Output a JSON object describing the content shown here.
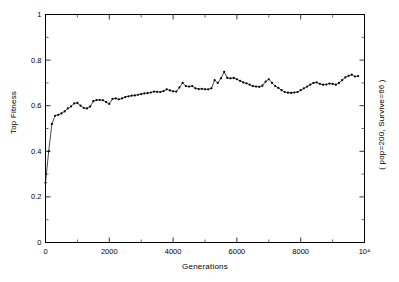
{
  "chart_data": {
    "type": "line",
    "title": "",
    "xlabel": "Generations",
    "ylabel": "Top Fitness",
    "annotation": "(  pop=200, Survive=66  )",
    "xlim": [
      0,
      10000
    ],
    "ylim": [
      0,
      1
    ],
    "xticks": [
      0,
      2000,
      4000,
      6000,
      8000,
      10000
    ],
    "xtick_labels": [
      "0",
      "2000",
      "4000",
      "6000",
      "8000",
      "10⁴"
    ],
    "yticks": [
      0,
      0.2,
      0.4,
      0.6,
      0.8,
      1
    ],
    "ytick_labels": [
      "0",
      "0.2",
      "0.4",
      "0.6",
      "0.8",
      "1"
    ],
    "grid": false,
    "legend": null,
    "marker": "filled-circle",
    "series": [
      {
        "name": "Top Fitness",
        "x": [
          0,
          100,
          200,
          300,
          400,
          500,
          600,
          700,
          800,
          900,
          1000,
          1100,
          1200,
          1300,
          1400,
          1500,
          1600,
          1700,
          1800,
          1900,
          2000,
          2100,
          2200,
          2300,
          2400,
          2500,
          2600,
          2700,
          2800,
          2900,
          3000,
          3100,
          3200,
          3300,
          3400,
          3500,
          3600,
          3700,
          3800,
          3900,
          4000,
          4100,
          4200,
          4300,
          4400,
          4500,
          4600,
          4700,
          4800,
          4900,
          5000,
          5100,
          5200,
          5300,
          5400,
          5500,
          5600,
          5700,
          5800,
          5900,
          6000,
          6100,
          6200,
          6300,
          6400,
          6500,
          6600,
          6700,
          6800,
          6900,
          7000,
          7100,
          7200,
          7300,
          7400,
          7500,
          7600,
          7700,
          7800,
          7900,
          8000,
          8100,
          8200,
          8300,
          8400,
          8500,
          8600,
          8700,
          8800,
          8900,
          9000,
          9100,
          9200,
          9300,
          9400,
          9500,
          9600,
          9700,
          9800
        ],
        "y": [
          0.262,
          0.4,
          0.52,
          0.556,
          0.56,
          0.566,
          0.575,
          0.588,
          0.597,
          0.61,
          0.612,
          0.6,
          0.59,
          0.588,
          0.596,
          0.62,
          0.625,
          0.625,
          0.624,
          0.616,
          0.608,
          0.63,
          0.632,
          0.628,
          0.632,
          0.638,
          0.641,
          0.644,
          0.645,
          0.648,
          0.651,
          0.654,
          0.655,
          0.658,
          0.662,
          0.661,
          0.66,
          0.664,
          0.672,
          0.667,
          0.663,
          0.662,
          0.68,
          0.7,
          0.686,
          0.684,
          0.686,
          0.676,
          0.673,
          0.674,
          0.672,
          0.672,
          0.676,
          0.712,
          0.7,
          0.72,
          0.748,
          0.722,
          0.72,
          0.722,
          0.716,
          0.709,
          0.702,
          0.698,
          0.692,
          0.686,
          0.684,
          0.683,
          0.688,
          0.706,
          0.716,
          0.7,
          0.686,
          0.678,
          0.668,
          0.66,
          0.657,
          0.656,
          0.658,
          0.66,
          0.668,
          0.676,
          0.684,
          0.692,
          0.7,
          0.702,
          0.696,
          0.692,
          0.693,
          0.697,
          0.696,
          0.692,
          0.7,
          0.712,
          0.724,
          0.731,
          0.736,
          0.728,
          0.73
        ]
      }
    ]
  }
}
